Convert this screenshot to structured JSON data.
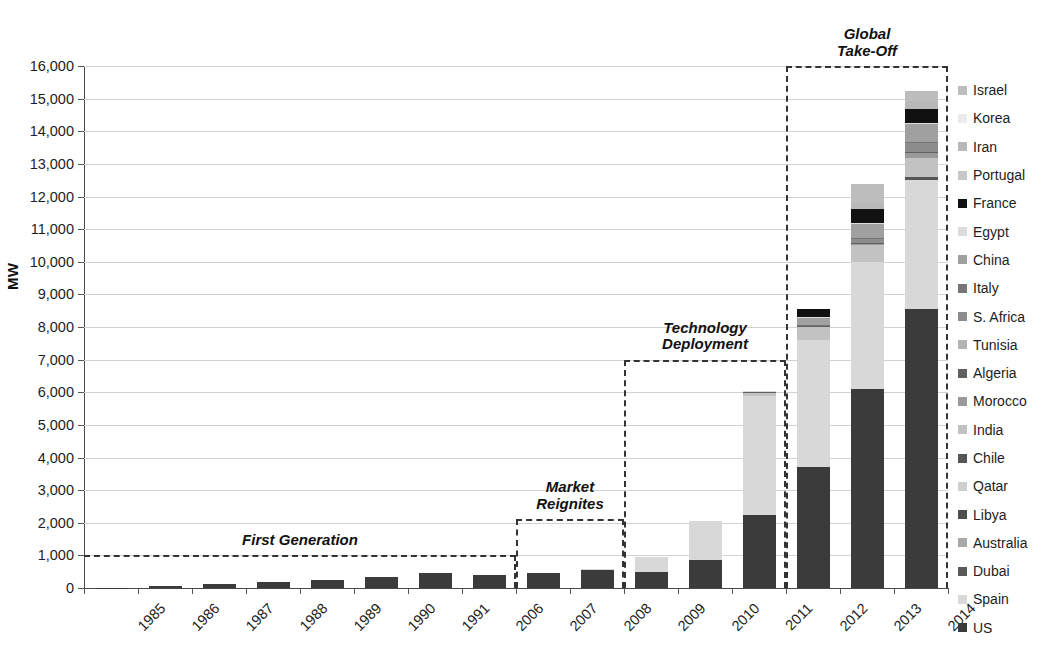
{
  "chart_data": {
    "type": "bar",
    "subtype": "stacked-bar",
    "title": "",
    "xlabel": "",
    "ylabel": "MW",
    "ylim": [
      0,
      16000
    ],
    "ytick_step": 1000,
    "ytick_labels": [
      "16,000",
      "15,000",
      "14,000",
      "13,000",
      "12,000",
      "11,000",
      "10,000",
      "9,000",
      "8,000",
      "7,000",
      "6,000",
      "5,000",
      "4,000",
      "3,000",
      "2,000",
      "1,000",
      "0"
    ],
    "grid": true,
    "legend_position": "right",
    "categories": [
      "1985",
      "1986",
      "1987",
      "1988",
      "1989",
      "1990",
      "1991",
      "2006",
      "2007",
      "2008",
      "2009",
      "2010",
      "2011",
      "2012",
      "2013",
      "2014"
    ],
    "series": [
      {
        "name": "US",
        "color": "#3b3b3b",
        "values": [
          14,
          60,
          128,
          180,
          250,
          352,
          450,
          400,
          446,
          560,
          505,
          870,
          2250,
          3700,
          6100,
          8550
        ]
      },
      {
        "name": "Spain",
        "color": "#d8d8d8",
        "values": [
          0,
          0,
          0,
          0,
          0,
          0,
          0,
          0,
          0,
          31,
          445,
          1180,
          3650,
          3900,
          3900,
          3950
        ]
      },
      {
        "name": "Dubai",
        "color": "#5a5a5a",
        "values": [
          0,
          0,
          0,
          0,
          0,
          0,
          0,
          0,
          0,
          0,
          0,
          0,
          0,
          0,
          0,
          0
        ]
      },
      {
        "name": "Australia",
        "color": "#a8a8a8",
        "values": [
          0,
          0,
          0,
          0,
          0,
          0,
          0,
          0,
          0,
          0,
          0,
          0,
          0,
          0,
          0,
          0
        ]
      },
      {
        "name": "Libya",
        "color": "#4e4e4e",
        "values": [
          0,
          0,
          0,
          0,
          0,
          0,
          0,
          0,
          0,
          0,
          0,
          0,
          0,
          0,
          0,
          0
        ]
      },
      {
        "name": "Qatar",
        "color": "#cfcfcf",
        "values": [
          0,
          0,
          0,
          0,
          0,
          0,
          0,
          0,
          0,
          0,
          0,
          0,
          0,
          0,
          0,
          0
        ]
      },
      {
        "name": "Chile",
        "color": "#555555",
        "values": [
          0,
          0,
          0,
          0,
          0,
          0,
          0,
          0,
          0,
          0,
          0,
          0,
          0,
          0,
          0,
          110
        ]
      },
      {
        "name": "India",
        "color": "#c2c2c2",
        "values": [
          0,
          0,
          0,
          0,
          0,
          0,
          0,
          0,
          0,
          0,
          0,
          0,
          75,
          400,
          520,
          560
        ]
      },
      {
        "name": "Morocco",
        "color": "#9a9a9a",
        "values": [
          0,
          0,
          0,
          0,
          0,
          0,
          0,
          0,
          0,
          0,
          0,
          0,
          20,
          20,
          20,
          180
        ]
      },
      {
        "name": "Algeria",
        "color": "#606060",
        "values": [
          0,
          0,
          0,
          0,
          0,
          0,
          0,
          0,
          0,
          0,
          0,
          0,
          25,
          25,
          25,
          25
        ]
      },
      {
        "name": "Tunisia",
        "color": "#b4b4b4",
        "values": [
          0,
          0,
          0,
          0,
          0,
          0,
          0,
          0,
          0,
          0,
          0,
          0,
          0,
          0,
          0,
          0
        ]
      },
      {
        "name": "S. Africa",
        "color": "#8c8c8c",
        "values": [
          0,
          0,
          0,
          0,
          0,
          0,
          0,
          0,
          0,
          0,
          0,
          0,
          0,
          0,
          150,
          300
        ]
      },
      {
        "name": "Italy",
        "color": "#767676",
        "values": [
          0,
          0,
          0,
          0,
          0,
          0,
          0,
          0,
          0,
          0,
          0,
          0,
          5,
          5,
          5,
          5
        ]
      },
      {
        "name": "China",
        "color": "#a0a0a0",
        "values": [
          0,
          0,
          0,
          0,
          0,
          0,
          0,
          0,
          0,
          0,
          0,
          0,
          0,
          240,
          460,
          540
        ]
      },
      {
        "name": "Egypt",
        "color": "#dcdcdc",
        "values": [
          0,
          0,
          0,
          0,
          0,
          0,
          0,
          0,
          0,
          0,
          0,
          0,
          20,
          20,
          20,
          20
        ]
      },
      {
        "name": "France",
        "color": "#111111",
        "values": [
          0,
          0,
          0,
          0,
          0,
          0,
          0,
          0,
          0,
          0,
          0,
          0,
          0,
          250,
          430,
          430
        ]
      },
      {
        "name": "Portugal",
        "color": "#c8c8c8",
        "values": [
          0,
          0,
          0,
          0,
          0,
          0,
          0,
          0,
          0,
          0,
          0,
          0,
          0,
          0,
          0,
          0
        ]
      },
      {
        "name": "Iran",
        "color": "#b8b8b8",
        "values": [
          0,
          0,
          0,
          0,
          0,
          0,
          0,
          0,
          0,
          0,
          0,
          0,
          0,
          0,
          200,
          250
        ]
      },
      {
        "name": "Israel",
        "color": "#bdbdbd",
        "values": [
          0,
          0,
          0,
          0,
          0,
          0,
          0,
          0,
          0,
          0,
          0,
          0,
          0,
          0,
          550,
          300
        ]
      }
    ],
    "totals": [
      14,
      60,
      128,
      180,
      250,
      352,
      450,
      400,
      446,
      591,
      950,
      2050,
      6045,
      8560,
      12380,
      15220
    ],
    "annotations": [
      {
        "id": "first-generation",
        "label": "First Generation",
        "from": "1985",
        "to": "2006",
        "box_top_value": 1000
      },
      {
        "id": "market-reignites",
        "label": "Market\nReignites",
        "from": "2007",
        "to": "2008",
        "box_top_value": 2100
      },
      {
        "id": "technology-deployment",
        "label": "Technology\nDeployment",
        "from": "2009",
        "to": "2011",
        "box_top_value": 7000
      },
      {
        "id": "global-take-off",
        "label": "Global\nTake-Off",
        "from": "2012",
        "to": "2014",
        "box_top_value": 16000
      }
    ]
  },
  "legend": {
    "items": [
      {
        "label": "Israel",
        "color": "#bdbdbd"
      },
      {
        "label": "Korea",
        "color": "#ebebeb"
      },
      {
        "label": "Iran",
        "color": "#b8b8b8"
      },
      {
        "label": "Portugal",
        "color": "#c8c8c8"
      },
      {
        "label": "France",
        "color": "#111111"
      },
      {
        "label": "Egypt",
        "color": "#dcdcdc"
      },
      {
        "label": "China",
        "color": "#a0a0a0"
      },
      {
        "label": "Italy",
        "color": "#767676"
      },
      {
        "label": "S. Africa",
        "color": "#8c8c8c"
      },
      {
        "label": "Tunisia",
        "color": "#b4b4b4"
      },
      {
        "label": "Algeria",
        "color": "#606060"
      },
      {
        "label": "Morocco",
        "color": "#9a9a9a"
      },
      {
        "label": "India",
        "color": "#c2c2c2"
      },
      {
        "label": "Chile",
        "color": "#555555"
      },
      {
        "label": "Qatar",
        "color": "#cfcfcf"
      },
      {
        "label": "Libya",
        "color": "#4e4e4e"
      },
      {
        "label": "Australia",
        "color": "#a8a8a8"
      },
      {
        "label": "Dubai",
        "color": "#5a5a5a"
      },
      {
        "label": "Spain",
        "color": "#d8d8d8"
      },
      {
        "label": "US",
        "color": "#3b3b3b"
      }
    ]
  }
}
